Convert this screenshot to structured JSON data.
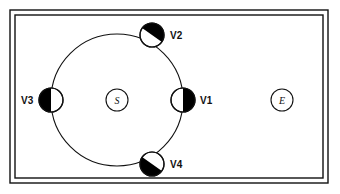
{
  "figure": {
    "background_color": "#ffffff",
    "stroke_color": "#111111",
    "fill_color": "#000000",
    "frame": {
      "name": "double-line-border",
      "outer": {
        "x": 10,
        "y": 10,
        "width": 318,
        "height": 173
      },
      "inner": {
        "x": 15,
        "y": 15,
        "width": 308,
        "height": 163
      },
      "line_width": 1.4
    },
    "ring": {
      "name": "main-ring-circle",
      "center_x": 117,
      "center_y": 100,
      "radius": 66,
      "line_width": 1.1
    },
    "center_node": {
      "label": "S",
      "cx": 117,
      "cy": 100,
      "r": 11
    },
    "external_node": {
      "label": "E",
      "cx": 282,
      "cy": 100,
      "r": 11
    },
    "vertices": [
      {
        "id": "v1",
        "label": "V1",
        "cx": 183,
        "cy": 100,
        "r": 12,
        "shading": "right-half",
        "split_angle_deg": 90,
        "label_x": 200,
        "label_y": 104
      },
      {
        "id": "v2",
        "label": "V2",
        "cx": 152,
        "cy": 35,
        "r": 12,
        "shading": "upper-diagonal",
        "split_angle_deg": 35,
        "label_x": 170,
        "label_y": 39
      },
      {
        "id": "v3",
        "label": "V3",
        "cx": 51,
        "cy": 100,
        "r": 12,
        "shading": "left-half",
        "split_angle_deg": 270,
        "label_x": 21,
        "label_y": 104
      },
      {
        "id": "v4",
        "label": "V4",
        "cx": 152,
        "cy": 164,
        "r": 12,
        "shading": "lower-diagonal",
        "split_angle_deg": 215,
        "label_x": 170,
        "label_y": 168
      }
    ]
  }
}
